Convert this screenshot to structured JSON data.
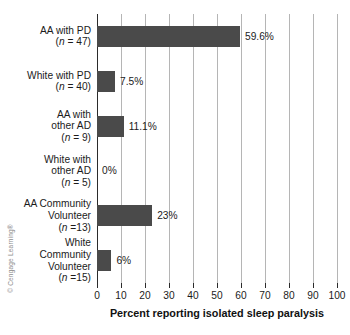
{
  "credit": "© Cengage Learning®",
  "chart_data": {
    "type": "bar",
    "orientation": "horizontal",
    "title": "",
    "xlabel": "Percent reporting isolated sleep paralysis",
    "ylabel": "",
    "xlim": [
      0,
      100
    ],
    "xticks": [
      0,
      10,
      20,
      30,
      40,
      50,
      60,
      70,
      80,
      90,
      100
    ],
    "xtick_labels": [
      "0",
      "10",
      "20",
      "30",
      "40",
      "50",
      "60",
      "70",
      "80",
      "90",
      "100"
    ],
    "grid": "vertical",
    "legend": "none",
    "bar_color": "#4a4a4a",
    "gridline_color": "#b5b5b5",
    "axis_color": "#2b2b2b",
    "categories": [
      "AA with PD (n = 47)",
      "White with PD (n = 40)",
      "AA with other AD (n = 9)",
      "White with other AD (n = 5)",
      "AA Community Volunteer (n =13)",
      "White Community Volunteer (n =15)"
    ],
    "values": [
      59.6,
      7.5,
      11.1,
      0,
      23,
      6
    ],
    "value_labels": [
      "59.6%",
      "7.5%",
      "11.1%",
      "0%",
      "23%",
      "6%"
    ],
    "category_label_lines": [
      [
        "AA with PD",
        "(n = 47)"
      ],
      [
        "White with PD",
        "(n = 40)"
      ],
      [
        "AA with",
        "other AD",
        "(n = 9)"
      ],
      [
        "White with",
        "other AD",
        "(n = 5)"
      ],
      [
        "AA Community",
        "Volunteer",
        "(n =13)"
      ],
      [
        "White",
        "Community",
        "Volunteer",
        "(n =15)"
      ]
    ]
  }
}
